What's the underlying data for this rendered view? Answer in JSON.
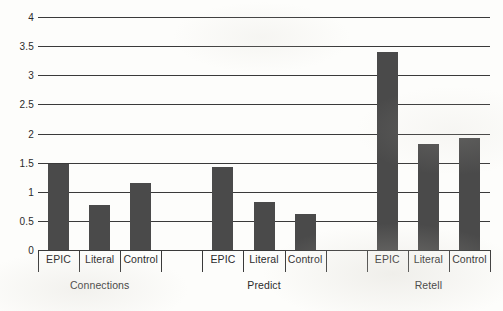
{
  "chart_data": {
    "type": "bar",
    "title": "",
    "xlabel": "",
    "ylabel": "",
    "ylim": [
      0,
      4
    ],
    "ytick_labels": [
      "0",
      "0.5",
      "1",
      "1.5",
      "2",
      "2.5",
      "3",
      "3.5",
      "4"
    ],
    "ytick_values": [
      0,
      0.5,
      1,
      1.5,
      2,
      2.5,
      3,
      3.5,
      4
    ],
    "grid": true,
    "legend": "none",
    "groups": [
      "Connections",
      "Predict",
      "Retell"
    ],
    "categories": [
      "EPIC",
      "Literal",
      "Control"
    ],
    "series": [
      {
        "name": "EPIC",
        "values": [
          1.48,
          1.42,
          3.4
        ]
      },
      {
        "name": "Literal",
        "values": [
          0.78,
          0.82,
          1.82
        ]
      },
      {
        "name": "Control",
        "values": [
          1.15,
          0.62,
          1.93
        ]
      }
    ],
    "bars": [
      {
        "group": "Connections",
        "category": "EPIC",
        "value": 1.48
      },
      {
        "group": "Connections",
        "category": "Literal",
        "value": 0.78
      },
      {
        "group": "Connections",
        "category": "Control",
        "value": 1.15
      },
      {
        "group": "Predict",
        "category": "EPIC",
        "value": 1.42
      },
      {
        "group": "Predict",
        "category": "Literal",
        "value": 0.82
      },
      {
        "group": "Predict",
        "category": "Control",
        "value": 0.62
      },
      {
        "group": "Retell",
        "category": "EPIC",
        "value": 3.4
      },
      {
        "group": "Retell",
        "category": "Literal",
        "value": 1.82
      },
      {
        "group": "Retell",
        "category": "Control",
        "value": 1.93
      }
    ],
    "colors": {
      "bar": "#4a4a4a",
      "grid": "#3a3a3a",
      "text": "#2b2b2b",
      "background": "#fdfdfb"
    }
  }
}
